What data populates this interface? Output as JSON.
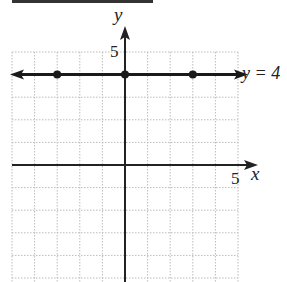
{
  "chart_data": {
    "type": "line",
    "title": "",
    "xlabel": "x",
    "ylabel": "y",
    "xlim": [
      -5,
      5
    ],
    "ylim": [
      -5,
      5
    ],
    "grid": true,
    "x_tick_labels": [
      "5"
    ],
    "y_tick_labels": [
      "5"
    ],
    "series": [
      {
        "name": "y = 4",
        "equation": "y = 4",
        "points": [
          [
            -3,
            4
          ],
          [
            0,
            4
          ],
          [
            3,
            4
          ]
        ],
        "arrows_both_ends": true
      }
    ],
    "annotations": [
      "y = 4"
    ]
  },
  "labels": {
    "x_axis": "x",
    "y_axis": "y",
    "x_tick": "5",
    "y_tick": "5",
    "line_label": "y = 4"
  },
  "colors": {
    "axis": "#222222",
    "grid": "#bbbbbb",
    "line": "#1a1a1a"
  }
}
